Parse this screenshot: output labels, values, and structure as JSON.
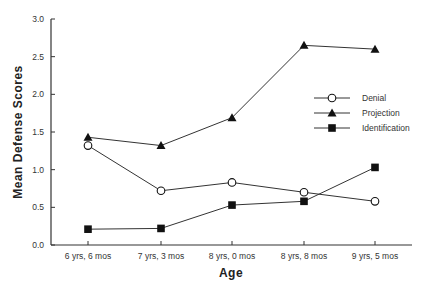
{
  "chart_data": {
    "type": "line",
    "title": "",
    "xlabel": "Age",
    "ylabel": "Mean Defense Scores",
    "ylim": [
      0.0,
      3.0
    ],
    "yticks": [
      "0.0",
      "0.5",
      "1.0",
      "1.5",
      "2.0",
      "2.5",
      "3.0"
    ],
    "categories": [
      "6 yrs, 6 mos",
      "7 yrs, 3 mos",
      "8 yrs, 0 mos",
      "8 yrs, 8 mos",
      "9 yrs, 5 mos"
    ],
    "grid": false,
    "legend_position": "right-center",
    "series": [
      {
        "name": "Denial",
        "marker": "open-circle",
        "values": [
          1.32,
          0.72,
          0.83,
          0.7,
          0.58
        ]
      },
      {
        "name": "Projection",
        "marker": "filled-triangle",
        "values": [
          1.43,
          1.32,
          1.69,
          2.65,
          2.6
        ]
      },
      {
        "name": "Identification",
        "marker": "filled-square",
        "values": [
          0.21,
          0.22,
          0.53,
          0.58,
          1.03
        ]
      }
    ]
  },
  "colors": {
    "line": "#333333",
    "marker": "#111111",
    "background": "#ffffff"
  }
}
